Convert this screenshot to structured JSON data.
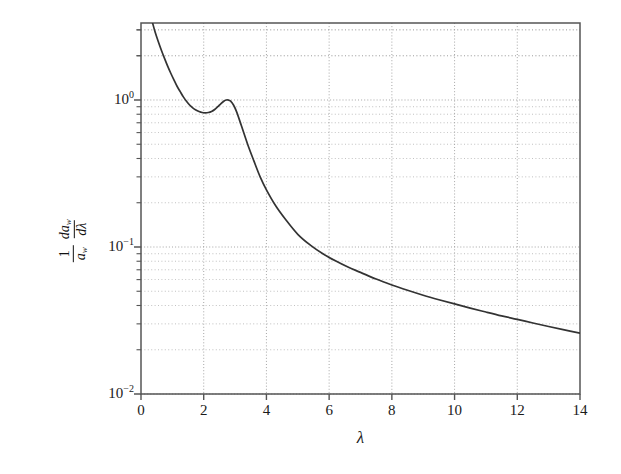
{
  "figure": {
    "background": "#ffffff",
    "axes_color": "#555555",
    "grid_color": "#999999",
    "curve_color": "#333333"
  },
  "chart_data": {
    "type": "line",
    "title": "",
    "subtitle": "",
    "xlabel": "λ",
    "ylabel_parts": {
      "outer_num": "1",
      "outer_den_var": "a",
      "outer_den_sub": "w",
      "inner_num_d": "d",
      "inner_num_var": "a",
      "inner_num_sub": "w",
      "inner_den_d": "d",
      "inner_den_var": "λ"
    },
    "ylabel_text": "(1/a_w) da_w/dλ",
    "xscale": "linear",
    "yscale": "log",
    "xlim": [
      0,
      14.0
    ],
    "ylim": [
      0.01,
      3.34
    ],
    "xticks": [
      0,
      2,
      4,
      6,
      8,
      10,
      12,
      14
    ],
    "xticklabels": [
      "0",
      "2",
      "4",
      "6",
      "8",
      "10",
      "12",
      "14"
    ],
    "yticks": [
      1,
      0.1,
      0.01
    ],
    "yticklabels": [
      "10^0",
      "10^-1",
      "10^-2"
    ],
    "yticklabel_mantissa": [
      "10",
      "10",
      "10"
    ],
    "yticklabel_exponents": [
      "0",
      "−1",
      "−2"
    ],
    "grid": true,
    "grid_style": "dotted",
    "grid_minor_y": true,
    "grid_minor_x": false,
    "legend": null,
    "legend_position": "none",
    "annotations": [],
    "series": [
      {
        "name": "relative growth rate",
        "x": [
          0.37,
          0.45,
          0.55,
          0.65,
          0.75,
          0.85,
          0.95,
          1.05,
          1.15,
          1.25,
          1.35,
          1.45,
          1.55,
          1.65,
          1.75,
          1.85,
          1.95,
          2.05,
          2.15,
          2.25,
          2.35,
          2.45,
          2.55,
          2.65,
          2.72,
          2.78,
          2.85,
          2.95,
          3.05,
          3.2,
          3.4,
          3.6,
          3.8,
          4.0,
          4.3,
          4.6,
          5.0,
          5.4,
          5.8,
          6.2,
          6.6,
          7.0,
          7.5,
          8.0,
          8.5,
          9.0,
          9.5,
          10.0,
          10.5,
          11.0,
          11.5,
          12.0,
          12.5,
          13.0,
          13.5,
          14.0
        ],
        "y": [
          3.34,
          2.9,
          2.5,
          2.18,
          1.92,
          1.7,
          1.52,
          1.37,
          1.24,
          1.14,
          1.05,
          0.98,
          0.925,
          0.885,
          0.855,
          0.835,
          0.822,
          0.818,
          0.822,
          0.836,
          0.862,
          0.9,
          0.945,
          0.985,
          1.0,
          1.0,
          0.985,
          0.925,
          0.83,
          0.67,
          0.5,
          0.385,
          0.3,
          0.245,
          0.19,
          0.155,
          0.122,
          0.103,
          0.09,
          0.0805,
          0.073,
          0.0672,
          0.0605,
          0.0552,
          0.0508,
          0.047,
          0.0438,
          0.041,
          0.0384,
          0.0361,
          0.034,
          0.0322,
          0.0304,
          0.0288,
          0.0273,
          0.0259
        ]
      }
    ]
  },
  "axes_geometry": {
    "left_px": 141,
    "right_px": 580,
    "top_px": 23,
    "bottom_px": 394
  }
}
